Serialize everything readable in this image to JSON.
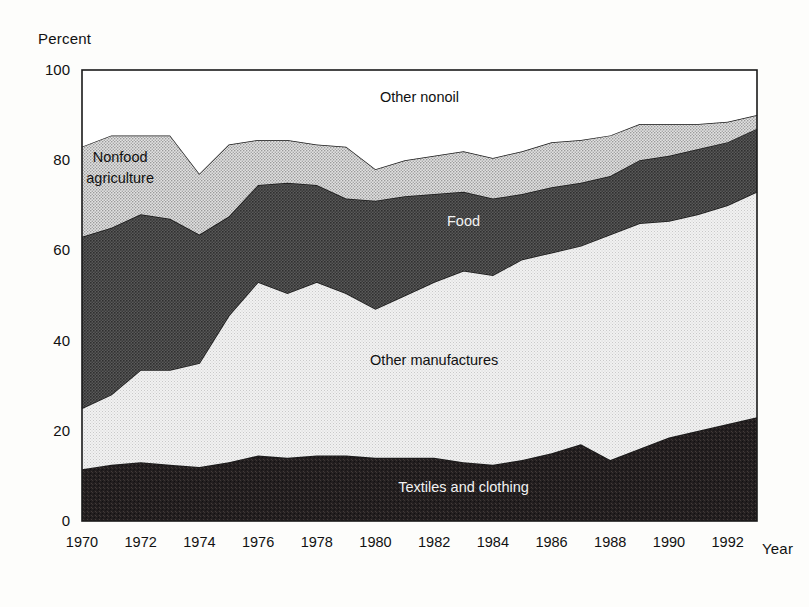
{
  "chart_data": {
    "type": "area",
    "stacked": true,
    "title": "",
    "xlabel": "Year",
    "ylabel": "Percent",
    "xlim": [
      1970,
      1993
    ],
    "ylim": [
      0,
      100
    ],
    "grid": false,
    "legend_position": "inline-annotations",
    "x_tick_labels": [
      "1970",
      "1972",
      "1974",
      "1976",
      "1978",
      "1980",
      "1982",
      "1984",
      "1986",
      "1988",
      "1990",
      "1992"
    ],
    "x_ticks": [
      1970,
      1972,
      1974,
      1976,
      1978,
      1980,
      1982,
      1984,
      1986,
      1988,
      1990,
      1992
    ],
    "y_tick_labels": [
      "0",
      "20",
      "40",
      "60",
      "80",
      "100"
    ],
    "y_ticks": [
      0,
      20,
      40,
      60,
      80,
      100
    ],
    "x": [
      1970,
      1971,
      1972,
      1973,
      1974,
      1975,
      1976,
      1977,
      1978,
      1979,
      1980,
      1981,
      1982,
      1983,
      1984,
      1985,
      1986,
      1987,
      1988,
      1989,
      1990,
      1991,
      1992,
      1993
    ],
    "series": [
      {
        "name": "Textiles and clothing",
        "label": "Textiles and clothing",
        "fill": "#231f20",
        "label_color": "#f2f2f2",
        "values": [
          11.5,
          12.5,
          13.0,
          12.5,
          12.0,
          13.0,
          14.5,
          14.0,
          14.5,
          14.5,
          14.0,
          14.0,
          14.0,
          13.0,
          12.5,
          13.5,
          15.0,
          17.0,
          13.5,
          16.0,
          18.5,
          20.0,
          21.5,
          23.0
        ]
      },
      {
        "name": "Other manufactures",
        "label": "Other manufactures",
        "fill": "#ededed",
        "label_color": "#111111",
        "values": [
          13.5,
          15.5,
          20.5,
          21.0,
          23.0,
          32.5,
          38.5,
          36.5,
          38.5,
          36.0,
          33.0,
          36.0,
          39.0,
          42.5,
          42.0,
          44.5,
          44.5,
          44.0,
          50.0,
          50.0,
          48.0,
          48.0,
          48.5,
          50.0
        ]
      },
      {
        "name": "Food",
        "label": "Food",
        "fill": "#4a4a4a",
        "label_color": "#f2f2f2",
        "values": [
          38.0,
          37.0,
          34.5,
          33.5,
          28.5,
          22.0,
          21.5,
          24.5,
          21.5,
          21.0,
          24.0,
          22.0,
          19.5,
          17.5,
          17.0,
          14.5,
          14.5,
          14.0,
          13.0,
          14.0,
          14.5,
          14.5,
          14.0,
          14.0
        ]
      },
      {
        "name": "Nonfood agriculture",
        "label": "Nonfood agriculture",
        "fill": "#d6d6d6",
        "label_color": "#111111",
        "values": [
          20.0,
          20.5,
          17.5,
          18.5,
          13.5,
          16.0,
          10.0,
          9.5,
          9.0,
          11.5,
          7.0,
          8.0,
          8.5,
          9.0,
          9.0,
          9.5,
          10.0,
          9.5,
          9.0,
          8.0,
          7.0,
          5.5,
          4.5,
          3.0
        ]
      },
      {
        "name": "Other nonoil",
        "label": "Other nonoil",
        "fill": "#ffffff",
        "label_color": "#111111",
        "values": [
          17.0,
          14.5,
          14.5,
          14.5,
          23.0,
          16.5,
          15.5,
          15.5,
          16.5,
          17.0,
          22.0,
          20.0,
          19.0,
          18.0,
          19.5,
          18.0,
          16.0,
          15.5,
          14.5,
          12.0,
          12.0,
          12.0,
          11.5,
          10.0
        ]
      }
    ],
    "annotations": [
      {
        "text": "Other nonoil",
        "x": 1981.5,
        "y": 93.0,
        "color": "#111111"
      },
      {
        "text": "Nonfood",
        "x": 1971.3,
        "y": 79.5,
        "color": "#111111"
      },
      {
        "text": "agriculture",
        "x": 1971.3,
        "y": 75.0,
        "color": "#111111"
      },
      {
        "text": "Food",
        "x": 1983.0,
        "y": 65.5,
        "color": "#f2f2f2"
      },
      {
        "text": "Other manufactures",
        "x": 1982.0,
        "y": 34.5,
        "color": "#111111"
      },
      {
        "text": "Textiles and clothing",
        "x": 1983.0,
        "y": 6.5,
        "color": "#f2f2f2"
      }
    ]
  }
}
